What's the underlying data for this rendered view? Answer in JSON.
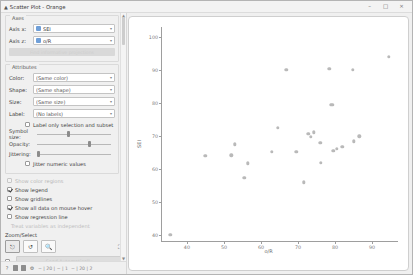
{
  "window": {
    "title": "Scatter Plot - Orange",
    "icon": "orange-widget-icon",
    "minimize": "–",
    "maximize": "□",
    "close": "×"
  },
  "panel": {
    "axes": {
      "title": "Axes",
      "x_label": "Axis x:",
      "x_value": "SEI",
      "z_label": "Axis z:",
      "z_value": "o/R",
      "info_button": "Find informative projections"
    },
    "attributes": {
      "title": "Attributes",
      "color_label": "Color:",
      "color_value": "(Same color)",
      "shape_label": "Shape:",
      "shape_value": "(Same shape)",
      "size_label": "Size:",
      "size_value": "(Same size)",
      "label_label": "Label:",
      "label_value": "(No labels)",
      "label_only_selection": "Label only selection and subset",
      "symbol_size_label": "Symbol size:",
      "opacity_label": "Opacity:",
      "jittering_label": "Jittering:",
      "jitter_numeric": "Jitter numeric values"
    },
    "plot_options": {
      "show_color_regions": "Show color regions",
      "show_legend": "Show legend",
      "show_gridlines": "Show gridlines",
      "show_hover": "Show all data on mouse hover",
      "show_regression": "Show regression line",
      "treat_as_independent": "Treat variables as independent"
    },
    "zoom_select": {
      "title": "Zoom/Select",
      "select_icon": "cursor-select-icon",
      "pan_icon": "pan-reset-icon",
      "zoom_icon": "magnifier-zoom-icon",
      "fit_icon": "fit-to-screen-icon"
    },
    "send": {
      "auto_label": "Send Automatically"
    },
    "statusbar": {
      "help_icon": "help-icon",
      "report_icon": "report-icon",
      "snapshot_icon": "snapshot-icon",
      "settings_icon": "settings-icon",
      "input_text": "− | 20 | − | 1",
      "output_text": "− | 20 | 2"
    }
  },
  "chart_data": {
    "type": "scatter",
    "title": "",
    "xlabel": "o/R",
    "ylabel": "SEI",
    "xlim": [
      33,
      97
    ],
    "ylim": [
      38,
      103
    ],
    "xticks": [
      40,
      50,
      60,
      70,
      80,
      90
    ],
    "yticks": [
      40,
      50,
      60,
      70,
      80,
      90,
      100
    ],
    "grid": false,
    "legend": false,
    "points": [
      {
        "x": 35.5,
        "y": 40.2
      },
      {
        "x": 45.0,
        "y": 64.0
      },
      {
        "x": 52.0,
        "y": 64.2
      },
      {
        "x": 53.0,
        "y": 67.5
      },
      {
        "x": 55.5,
        "y": 57.5
      },
      {
        "x": 56.5,
        "y": 61.8
      },
      {
        "x": 63.0,
        "y": 65.3
      },
      {
        "x": 64.5,
        "y": 72.5
      },
      {
        "x": 66.8,
        "y": 90.0
      },
      {
        "x": 69.5,
        "y": 65.2
      },
      {
        "x": 71.5,
        "y": 56.0
      },
      {
        "x": 72.8,
        "y": 70.8
      },
      {
        "x": 73.5,
        "y": 69.8
      },
      {
        "x": 74.2,
        "y": 71.2
      },
      {
        "x": 76.0,
        "y": 68.0
      },
      {
        "x": 76.2,
        "y": 62.0
      },
      {
        "x": 78.5,
        "y": 90.3
      },
      {
        "x": 78.8,
        "y": 79.5
      },
      {
        "x": 79.3,
        "y": 79.5
      },
      {
        "x": 79.5,
        "y": 65.5
      },
      {
        "x": 80.5,
        "y": 66.2
      },
      {
        "x": 82.0,
        "y": 66.8
      },
      {
        "x": 84.8,
        "y": 90.0
      },
      {
        "x": 85.0,
        "y": 68.5
      },
      {
        "x": 86.5,
        "y": 70.0
      },
      {
        "x": 94.5,
        "y": 94.0
      }
    ]
  }
}
